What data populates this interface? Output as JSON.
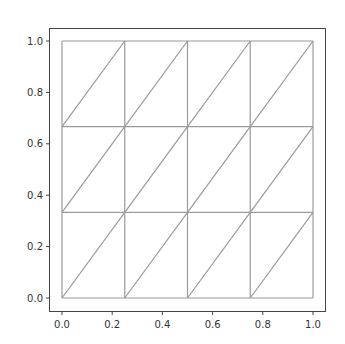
{
  "chart_data": {
    "type": "mesh",
    "title": "",
    "xlabel": "",
    "ylabel": "",
    "xlim": [
      0.0,
      1.0
    ],
    "ylim": [
      0.0,
      1.0
    ],
    "grid": false,
    "legend": null,
    "aspect": "equal",
    "x_ticks": [
      "0.0",
      "0.2",
      "0.4",
      "0.6",
      "0.8",
      "1.0"
    ],
    "y_ticks": [
      "0.0",
      "0.2",
      "0.4",
      "0.6",
      "0.8",
      "1.0"
    ],
    "x_tick_values": [
      0.0,
      0.2,
      0.4,
      0.6,
      0.8,
      1.0
    ],
    "y_tick_values": [
      0.0,
      0.2,
      0.4,
      0.6,
      0.8,
      1.0
    ],
    "mesh": {
      "description": "Structured triangular mesh of the unit square, 4 x 3 cells, each split by a diagonal from lower-left to upper-right",
      "nx": 4,
      "ny": 3,
      "x_nodes": [
        0.0,
        0.25,
        0.5,
        0.75,
        1.0
      ],
      "y_nodes": [
        0.0,
        0.3333,
        0.6667,
        1.0
      ],
      "diagonal": "lower-left to upper-right",
      "num_triangles": 24,
      "num_vertices": 20
    },
    "colors": {
      "mesh_line": "#9a9a9a",
      "axes_frame": "#444444",
      "tick_label": "#333333"
    }
  }
}
